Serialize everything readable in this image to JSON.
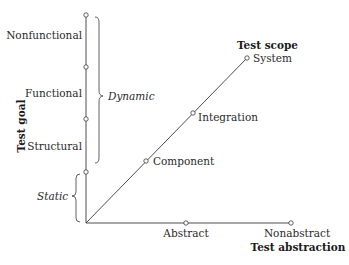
{
  "diagram": {
    "axes": {
      "vertical": {
        "title": "Test goal",
        "points": [
          "Nonfunctional",
          "Functional",
          "Structural"
        ]
      },
      "diagonal": {
        "title": "Test scope",
        "points": [
          "Component",
          "Integration",
          "System"
        ]
      },
      "horizontal": {
        "title": "Test abstraction",
        "points": [
          "Abstract",
          "Nonabstract"
        ]
      }
    },
    "groups": {
      "dynamic": "Dynamic",
      "static": "Static"
    }
  }
}
